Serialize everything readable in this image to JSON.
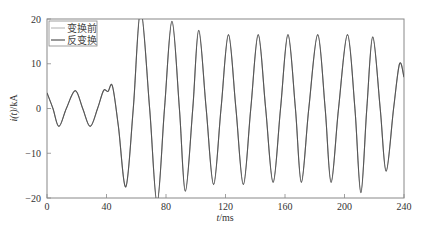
{
  "chart_data": {
    "type": "line",
    "title": "",
    "xlabel": "t/ms",
    "ylabel": "i(t)/kA",
    "xlim": [
      0,
      240
    ],
    "ylim": [
      -20,
      20
    ],
    "xticks": [
      0,
      40,
      80,
      120,
      160,
      200,
      240
    ],
    "yticks": [
      -20,
      -10,
      0,
      10,
      20
    ],
    "xtick_labels": [
      "0",
      "40",
      "80",
      "120",
      "160",
      "200",
      "240"
    ],
    "ytick_labels": [
      "−20",
      "−10",
      "0",
      "10",
      "20"
    ],
    "grid": false,
    "legend_position": "upper left",
    "line_color": "#555555",
    "series": [
      {
        "name": "变换前",
        "style": "thin",
        "x": [
          0,
          4,
          8,
          13,
          19,
          24,
          29,
          34,
          38,
          41,
          44,
          48,
          53,
          58,
          63,
          69,
          74,
          79,
          84,
          89,
          93,
          98,
          102,
          107,
          112,
          117,
          122,
          127,
          132,
          137,
          142,
          147,
          152,
          157,
          162,
          167,
          171,
          176,
          182,
          187,
          191,
          196,
          202,
          207,
          211,
          215,
          219,
          224,
          228,
          233,
          237,
          240
        ],
        "y": [
          3.5,
          0,
          -4,
          0,
          4,
          0,
          -4,
          0,
          4,
          3.8,
          5,
          -4,
          -17.5,
          0,
          22,
          0,
          -21,
          0,
          19.5,
          0,
          -18.5,
          0,
          17.5,
          0,
          -17,
          0,
          16.5,
          0,
          -17,
          0,
          16.5,
          0,
          -16.5,
          0,
          16.5,
          0,
          -16.5,
          0,
          16.5,
          0,
          -16.5,
          0,
          16.5,
          0,
          -18.8,
          0,
          16,
          0,
          -14,
          0,
          10,
          7
        ]
      },
      {
        "name": "反变换",
        "style": "thick",
        "x": [
          0,
          4,
          8,
          13,
          19,
          24,
          29,
          34,
          38,
          41,
          44,
          48,
          53,
          58,
          63,
          69,
          74,
          79,
          84,
          89,
          93,
          98,
          102,
          107,
          112,
          117,
          122,
          127,
          132,
          137,
          142,
          147,
          152,
          157,
          162,
          167,
          171,
          176,
          182,
          187,
          191,
          196,
          202,
          207,
          211,
          215,
          219,
          224,
          228,
          233,
          237,
          240
        ],
        "y": [
          3.5,
          0,
          -4,
          0,
          4,
          0,
          -4,
          0,
          4,
          3.8,
          5,
          -4,
          -17.5,
          0,
          22,
          0,
          -21,
          0,
          19.5,
          0,
          -18.5,
          0,
          17.5,
          0,
          -17,
          0,
          16.5,
          0,
          -17,
          0,
          16.5,
          0,
          -16.5,
          0,
          16.5,
          0,
          -16.5,
          0,
          16.5,
          0,
          -16.5,
          0,
          16.5,
          0,
          -18.8,
          0,
          16,
          0,
          -14,
          0,
          10,
          7
        ]
      }
    ]
  },
  "legend": {
    "items": [
      {
        "label": "变换前"
      },
      {
        "label": "反变换"
      }
    ]
  },
  "axes": {
    "xlabel_italic": "t",
    "xlabel_unit": "/ms",
    "ylabel_italic": "i(t)",
    "ylabel_unit": "/kA"
  }
}
